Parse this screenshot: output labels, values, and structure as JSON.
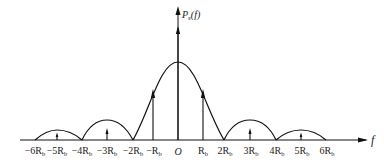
{
  "diagram": {
    "y_axis_label": {
      "main": "P",
      "sub": "s",
      "arg": "(f)"
    },
    "x_axis_label": "f",
    "origin_label": "O",
    "ticks": [
      {
        "label": "−6R",
        "sub": "b",
        "x": 35
      },
      {
        "label": "−5R",
        "sub": "b",
        "x": 57
      },
      {
        "label": "−4R",
        "sub": "b",
        "x": 82
      },
      {
        "label": "−3R",
        "sub": "b",
        "x": 107
      },
      {
        "label": "−2R",
        "sub": "b",
        "x": 133
      },
      {
        "label": "−R",
        "sub": "b",
        "x": 153
      },
      {
        "label": "R",
        "sub": "b",
        "x": 203
      },
      {
        "label": "2R",
        "sub": "b",
        "x": 224
      },
      {
        "label": "3R",
        "sub": "b",
        "x": 250
      },
      {
        "label": "4R",
        "sub": "b",
        "x": 276
      },
      {
        "label": "5R",
        "sub": "b",
        "x": 301
      },
      {
        "label": "6R",
        "sub": "b",
        "x": 326
      }
    ],
    "line_color": "#111111"
  }
}
